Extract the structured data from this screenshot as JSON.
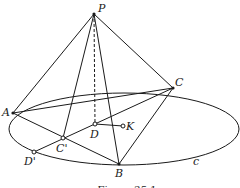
{
  "figure": {
    "caption": "Figure 25.1",
    "labels": {
      "P": "P",
      "A": "A",
      "B": "B",
      "C": "C",
      "D": "D",
      "K": "K",
      "C_prime": "C'",
      "D_prime": "D'",
      "c": "c"
    },
    "points": {
      "P": [
        94,
        14
      ],
      "A": [
        13,
        113
      ],
      "B": [
        119,
        164
      ],
      "C": [
        173,
        88
      ],
      "D": [
        95,
        124
      ],
      "K": [
        123,
        126
      ],
      "C_prime": [
        63,
        138
      ],
      "D_prime": [
        34,
        152
      ]
    },
    "ellipse": {
      "cx": 124,
      "cy": 129,
      "rx": 115,
      "ry": 36
    },
    "colors": {
      "stroke": "#1a1a1a",
      "background": "#ffffff"
    }
  }
}
